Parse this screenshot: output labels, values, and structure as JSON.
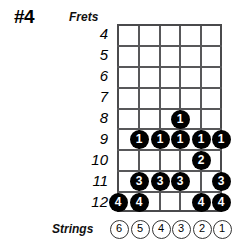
{
  "title": "#4",
  "labels": {
    "frets": "Frets",
    "strings": "Strings"
  },
  "colors": {
    "dot_fill": "#000000",
    "dot_text": "#ffffff",
    "grid_line": "#58585a",
    "background": "#ffffff"
  },
  "diagram": {
    "type": "guitar-scale-fretboard",
    "fret_numbers": [
      "4",
      "5",
      "6",
      "7",
      "8",
      "9",
      "10",
      "11",
      "12"
    ],
    "string_numbers": [
      "6",
      "5",
      "4",
      "3",
      "2",
      "1"
    ],
    "dots": [
      {
        "fret": "8",
        "string": "3",
        "finger": "1"
      },
      {
        "fret": "9",
        "string": "5",
        "finger": "1"
      },
      {
        "fret": "9",
        "string": "4",
        "finger": "1"
      },
      {
        "fret": "9",
        "string": "3",
        "finger": "1"
      },
      {
        "fret": "9",
        "string": "2",
        "finger": "1"
      },
      {
        "fret": "9",
        "string": "1",
        "finger": "1"
      },
      {
        "fret": "10",
        "string": "2",
        "finger": "2"
      },
      {
        "fret": "11",
        "string": "5",
        "finger": "3"
      },
      {
        "fret": "11",
        "string": "4",
        "finger": "3"
      },
      {
        "fret": "11",
        "string": "3",
        "finger": "3"
      },
      {
        "fret": "11",
        "string": "1",
        "finger": "3"
      },
      {
        "fret": "12",
        "string": "6",
        "finger": "4"
      },
      {
        "fret": "12",
        "string": "5",
        "finger": "4"
      },
      {
        "fret": "12",
        "string": "2",
        "finger": "4"
      },
      {
        "fret": "12",
        "string": "1",
        "finger": "4"
      }
    ]
  }
}
